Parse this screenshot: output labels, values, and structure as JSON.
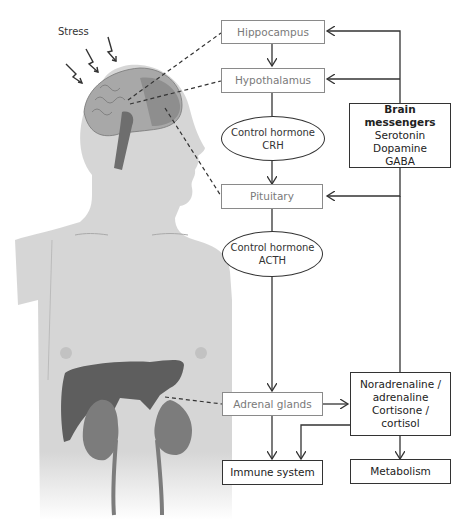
{
  "stress_label": "Stress",
  "nodes": {
    "hippocampus": "Hippocampus",
    "hypothalamus": "Hypothalamus",
    "crh": {
      "line1": "Control hormone",
      "line2": "CRH"
    },
    "pituitary": "Pituitary",
    "acth": {
      "line1": "Control hormone",
      "line2": "ACTH"
    },
    "adrenal": "Adrenal glands",
    "messengers": {
      "title": "Brain messengers",
      "items": [
        "Serotonin",
        "Dopamine",
        "GABA"
      ]
    },
    "hormones": {
      "lines": [
        "Noradrenaline /",
        "adrenaline",
        "Cortisone /",
        "cortisol"
      ]
    },
    "immune": "Immune system",
    "metabolism": "Metabolism"
  },
  "colors": {
    "body": "#d6d6d6",
    "brain": "#9a9a9a",
    "organ_dark": "#5e5e5e",
    "kidney": "#7c7c7c",
    "line": "#333333",
    "organ_text": "#7a7a7a"
  }
}
